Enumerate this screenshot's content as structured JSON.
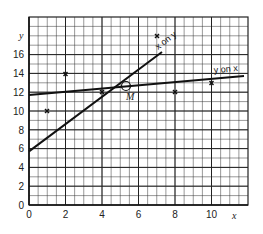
{
  "chart_data": {
    "type": "scatter",
    "title": "",
    "xlabel": "x",
    "ylabel": "y",
    "xlim": [
      0,
      12
    ],
    "ylim": [
      0,
      18
    ],
    "grid": true,
    "x_ticks": [
      "0",
      "2",
      "4",
      "6",
      "8",
      "10"
    ],
    "y_ticks": [
      "0",
      "2",
      "4",
      "6",
      "8",
      "10",
      "12",
      "14",
      "16"
    ],
    "points": [
      {
        "x": 1,
        "y": 10
      },
      {
        "x": 2,
        "y": 14
      },
      {
        "x": 4,
        "y": 12
      },
      {
        "x": 7,
        "y": 15
      },
      {
        "x": 8,
        "y": 12
      },
      {
        "x": 10,
        "y": 13
      }
    ],
    "mean_point": {
      "label": "M",
      "x": 5.3,
      "y": 12.7
    },
    "series": [
      {
        "name": "x on y",
        "type": "line",
        "x": [
          0,
          7.3
        ],
        "y": [
          5.7,
          16.3
        ]
      },
      {
        "name": "y on x",
        "type": "line",
        "x": [
          0,
          11.8
        ],
        "y": [
          11.7,
          13.7
        ]
      }
    ],
    "annotations": [
      "x on y",
      "y on x",
      "M"
    ]
  },
  "labels": {
    "x_axis": "x",
    "y_axis": "y",
    "x_on_y": "x on y",
    "y_on_x": "y on x",
    "mean": "M",
    "xt0": "0",
    "xt2": "2",
    "xt4": "4",
    "xt6": "6",
    "xt8": "8",
    "xt10": "10",
    "yt0": "0",
    "yt2": "2",
    "yt4": "4",
    "yt6": "6",
    "yt8": "8",
    "yt10": "10",
    "yt12": "12",
    "yt14": "14",
    "yt16": "16"
  }
}
